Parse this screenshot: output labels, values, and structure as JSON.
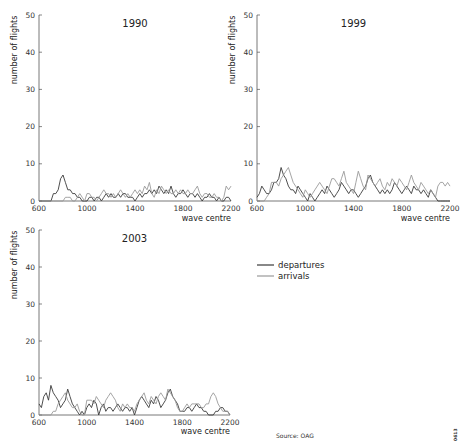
{
  "legend": {
    "departures_label": "departures",
    "arrivals_label": "arrivals"
  },
  "source_note": "Source: OAG",
  "figure_code": "0613",
  "colors": {
    "departures": "#3a3a3a",
    "arrivals": "#9a9a9a",
    "axis": "#555555"
  },
  "chart_data": [
    {
      "type": "line",
      "title": "1990",
      "xlabel": "wave centre",
      "ylabel": "number of flights",
      "xlim": [
        600,
        2200
      ],
      "ylim": [
        0,
        50
      ],
      "xticks": [
        600,
        1000,
        1400,
        1800,
        2200
      ],
      "yticks": [
        0,
        10,
        20,
        30,
        40,
        50
      ],
      "grid": false,
      "x": [
        600,
        650,
        700,
        720,
        740,
        760,
        780,
        800,
        820,
        840,
        860,
        880,
        900,
        920,
        940,
        960,
        980,
        1000,
        1020,
        1040,
        1060,
        1080,
        1100,
        1120,
        1140,
        1160,
        1180,
        1200,
        1220,
        1240,
        1260,
        1280,
        1300,
        1320,
        1340,
        1360,
        1380,
        1400,
        1420,
        1440,
        1460,
        1480,
        1500,
        1520,
        1540,
        1560,
        1580,
        1600,
        1620,
        1640,
        1660,
        1680,
        1700,
        1720,
        1740,
        1760,
        1780,
        1800,
        1820,
        1840,
        1860,
        1880,
        1900,
        1920,
        1940,
        1960,
        1980,
        2000,
        2020,
        2040,
        2060,
        2080,
        2100,
        2120,
        2140,
        2160,
        2180,
        2200
      ],
      "series": [
        {
          "name": "departures",
          "values": [
            0,
            0,
            0,
            2,
            2,
            3,
            6,
            7,
            5,
            3,
            3,
            2,
            2,
            1,
            1,
            0,
            0,
            0,
            1,
            1,
            0,
            1,
            1,
            0,
            1,
            2,
            1,
            2,
            1,
            1,
            2,
            1,
            2,
            2,
            1,
            1,
            1,
            0,
            1,
            2,
            1,
            2,
            2,
            3,
            2,
            3,
            2,
            4,
            3,
            2,
            3,
            2,
            4,
            2,
            1,
            2,
            2,
            3,
            2,
            1,
            2,
            2,
            1,
            2,
            1,
            0,
            1,
            1,
            2,
            1,
            1,
            0,
            1,
            0,
            0,
            1,
            1,
            0
          ]
        },
        {
          "name": "arrivals",
          "values": [
            0,
            0,
            0,
            0,
            0,
            0,
            0,
            0,
            1,
            1,
            1,
            0,
            0,
            1,
            2,
            1,
            0,
            2,
            2,
            1,
            1,
            0,
            1,
            2,
            3,
            2,
            2,
            1,
            2,
            1,
            2,
            3,
            2,
            1,
            2,
            1,
            2,
            3,
            2,
            3,
            2,
            4,
            3,
            5,
            2,
            1,
            3,
            2,
            4,
            3,
            2,
            3,
            2,
            2,
            3,
            2,
            3,
            2,
            2,
            3,
            2,
            2,
            3,
            4,
            2,
            1,
            2,
            2,
            1,
            1,
            2,
            1,
            1,
            0,
            1,
            4,
            3,
            4
          ]
        }
      ]
    },
    {
      "type": "line",
      "title": "1999",
      "xlabel": "wave centre",
      "ylabel": "number of flights",
      "xlim": [
        600,
        2200
      ],
      "ylim": [
        0,
        50
      ],
      "xticks": [
        600,
        1000,
        1400,
        1800,
        2200
      ],
      "yticks": [
        0,
        10,
        20,
        30,
        40,
        50
      ],
      "grid": false,
      "x": [
        600,
        620,
        640,
        660,
        680,
        700,
        720,
        740,
        760,
        780,
        800,
        820,
        840,
        860,
        880,
        900,
        920,
        940,
        960,
        980,
        1000,
        1020,
        1040,
        1060,
        1080,
        1100,
        1120,
        1140,
        1160,
        1180,
        1200,
        1220,
        1240,
        1260,
        1280,
        1300,
        1320,
        1340,
        1360,
        1380,
        1400,
        1420,
        1440,
        1460,
        1480,
        1500,
        1520,
        1540,
        1560,
        1580,
        1600,
        1620,
        1640,
        1660,
        1680,
        1700,
        1720,
        1740,
        1760,
        1780,
        1800,
        1820,
        1840,
        1860,
        1880,
        1900,
        1920,
        1940,
        1960,
        1980,
        2000,
        2020,
        2040,
        2060,
        2080,
        2100,
        2120,
        2140,
        2160,
        2180,
        2200
      ],
      "series": [
        {
          "name": "departures",
          "values": [
            1,
            2,
            4,
            3,
            2,
            2,
            3,
            5,
            5,
            6,
            9,
            7,
            6,
            4,
            3,
            3,
            2,
            4,
            3,
            2,
            1,
            0,
            2,
            1,
            0,
            1,
            2,
            3,
            2,
            4,
            3,
            2,
            1,
            2,
            3,
            5,
            4,
            3,
            2,
            3,
            3,
            2,
            1,
            2,
            3,
            4,
            6,
            7,
            5,
            4,
            3,
            2,
            3,
            2,
            3,
            2,
            3,
            5,
            4,
            3,
            2,
            3,
            4,
            3,
            2,
            4,
            3,
            3,
            2,
            3,
            2,
            1,
            3,
            2,
            1,
            0,
            0,
            0,
            0,
            0,
            0
          ]
        },
        {
          "name": "arrivals",
          "values": [
            0,
            0,
            0,
            0,
            1,
            2,
            5,
            5,
            5,
            4,
            6,
            7,
            8,
            9,
            7,
            5,
            4,
            3,
            2,
            1,
            3,
            2,
            1,
            2,
            3,
            4,
            5,
            4,
            3,
            2,
            4,
            6,
            6,
            5,
            4,
            6,
            8,
            5,
            4,
            3,
            2,
            5,
            8,
            6,
            4,
            3,
            7,
            6,
            5,
            4,
            5,
            6,
            4,
            3,
            5,
            4,
            6,
            5,
            4,
            6,
            5,
            4,
            3,
            5,
            7,
            5,
            4,
            3,
            5,
            4,
            3,
            2,
            3,
            2,
            1,
            4,
            5,
            5,
            4,
            5,
            4
          ]
        }
      ]
    },
    {
      "type": "line",
      "title": "2003",
      "xlabel": "wave centre",
      "ylabel": "number of flights",
      "xlim": [
        600,
        2200
      ],
      "ylim": [
        0,
        50
      ],
      "xticks": [
        600,
        1000,
        1400,
        1800,
        2200
      ],
      "yticks": [
        0,
        10,
        20,
        30,
        40,
        50
      ],
      "grid": false,
      "x": [
        600,
        620,
        640,
        660,
        680,
        700,
        720,
        740,
        760,
        780,
        800,
        820,
        840,
        860,
        880,
        900,
        920,
        940,
        960,
        980,
        1000,
        1020,
        1040,
        1060,
        1080,
        1100,
        1120,
        1140,
        1160,
        1180,
        1200,
        1220,
        1240,
        1260,
        1280,
        1300,
        1320,
        1340,
        1360,
        1380,
        1400,
        1420,
        1440,
        1460,
        1480,
        1500,
        1520,
        1540,
        1560,
        1580,
        1600,
        1620,
        1640,
        1660,
        1680,
        1700,
        1720,
        1740,
        1760,
        1780,
        1800,
        1820,
        1840,
        1860,
        1880,
        1900,
        1920,
        1940,
        1960,
        1980,
        2000,
        2020,
        2040,
        2060,
        2080,
        2100,
        2120,
        2140,
        2160,
        2180,
        2200
      ],
      "series": [
        {
          "name": "departures",
          "values": [
            3,
            2,
            5,
            6,
            4,
            8,
            6,
            5,
            4,
            2,
            3,
            4,
            7,
            5,
            3,
            2,
            1,
            0,
            1,
            0,
            2,
            3,
            2,
            4,
            3,
            0,
            2,
            3,
            1,
            2,
            2,
            1,
            2,
            3,
            2,
            1,
            2,
            2,
            1,
            2,
            0,
            2,
            4,
            5,
            4,
            3,
            2,
            4,
            3,
            5,
            4,
            2,
            3,
            4,
            6,
            7,
            5,
            4,
            3,
            1,
            1,
            1,
            2,
            2,
            1,
            2,
            3,
            2,
            2,
            1,
            1,
            0,
            0,
            0,
            1,
            1,
            2,
            2,
            1,
            1,
            0
          ]
        },
        {
          "name": "arrivals",
          "values": [
            0,
            0,
            0,
            0,
            0,
            0,
            1,
            1,
            3,
            4,
            5,
            6,
            4,
            3,
            2,
            2,
            3,
            1,
            0,
            0,
            4,
            4,
            4,
            3,
            5,
            4,
            3,
            2,
            4,
            5,
            6,
            5,
            4,
            2,
            1,
            3,
            2,
            3,
            2,
            2,
            1,
            3,
            4,
            5,
            6,
            4,
            3,
            5,
            4,
            3,
            5,
            6,
            5,
            4,
            7,
            6,
            5,
            4,
            2,
            1,
            1,
            2,
            3,
            2,
            3,
            3,
            3,
            3,
            2,
            2,
            3,
            3,
            5,
            6,
            5,
            3,
            2,
            1,
            1,
            1,
            0
          ]
        }
      ]
    }
  ]
}
